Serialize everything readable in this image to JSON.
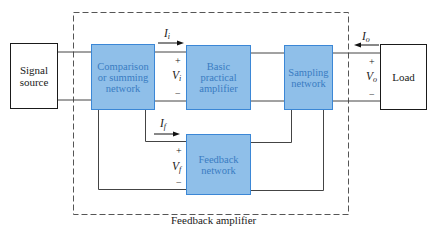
{
  "diagram": {
    "caption": "Feedback amplifier",
    "blocks": {
      "signal_source": "Signal source",
      "comparison": "Comparison or summing network",
      "basic_amplifier": "Basic practical amplifier",
      "sampling": "Sampling network",
      "feedback": "Feedback network",
      "load": "Load"
    },
    "labels": {
      "Ii": {
        "main": "I",
        "sub": "i"
      },
      "Vi": {
        "main": "V",
        "sub": "i"
      },
      "Io": {
        "main": "I",
        "sub": "o"
      },
      "Vo": {
        "main": "V",
        "sub": "o"
      },
      "If": {
        "main": "I",
        "sub": "f"
      },
      "Vf": {
        "main": "V",
        "sub": "f"
      },
      "plus": "+",
      "minus": "−"
    },
    "colors": {
      "block_fill": "#8fbfe9",
      "block_border": "#3b87d6",
      "block_text": "#3a7cc2",
      "wire": "#444444",
      "dashed_boundary": "#555555"
    }
  }
}
